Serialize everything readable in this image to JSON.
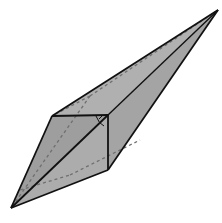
{
  "diagram": {
    "type": "polyhedron",
    "colors": {
      "background": "#ffffff",
      "face_fill": "#a9a9a9",
      "face_fill_dark": "#9a9a9a",
      "face_fill_light": "#b8b8b8",
      "edge": "#111111",
      "hidden_edge": "#6f6f6f"
    },
    "vertices": {
      "top_tip": [
        218,
        10
      ],
      "bottom_tip": [
        11,
        208
      ],
      "left": [
        52,
        116
      ],
      "right": [
        108,
        115
      ],
      "bottom": [
        108,
        170
      ],
      "hidden_back": [
        90,
        96
      ]
    },
    "right_angle_marker": true
  }
}
